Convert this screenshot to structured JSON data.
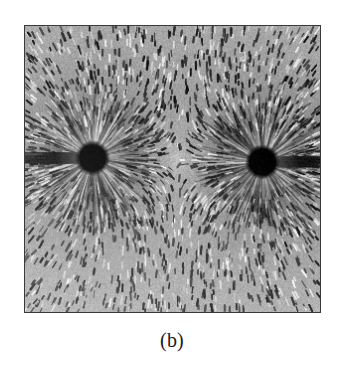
{
  "figure": {
    "label": "(b)",
    "type": "photograph",
    "frame": {
      "x": 24,
      "y": 25,
      "width": 297,
      "height": 288,
      "border_color": "#3a3a3a",
      "border_width": 2
    },
    "page_background": "#ffffff"
  },
  "chart_data": {
    "type": "scatter",
    "title": "(b)",
    "subtitle": "Field lines of two like point charges revealed by iron filings",
    "xlabel": "",
    "ylabel": "",
    "xlim": [
      0,
      297
    ],
    "ylim": [
      0,
      288
    ],
    "grid": false,
    "legend": "none",
    "annotations": [
      "Field lines radiate outward from each pole",
      "Lines bulge away from the midline between the poles",
      "A neutral (saddle) point lies midway between the two poles"
    ],
    "poles": [
      {
        "name": "left-pole",
        "x": 68,
        "y": 133,
        "radius": 12,
        "polarity": "like",
        "color": "#000000"
      },
      {
        "name": "right-pole",
        "x": 239,
        "y": 137,
        "radius": 12,
        "polarity": "like",
        "color": "#000000"
      }
    ],
    "neutral_point": {
      "x": 153,
      "y": 135
    },
    "tones": {
      "core_black": "#000000",
      "field_mid_gray": "#8c8c8c",
      "corner_light_gray": "#d2d2d2",
      "dark_streak": "#2e2e2e"
    },
    "values": [
      12,
      12
    ],
    "categories": [
      "left-pole",
      "right-pole"
    ]
  }
}
